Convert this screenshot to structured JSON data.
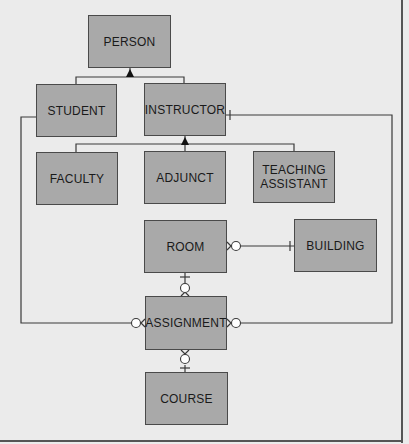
{
  "diagram": {
    "title": "",
    "colors": {
      "background": "#ebebeb",
      "entity_fill": "#a9a9a9",
      "entity_border": "#4a4a4a",
      "line": "#3a3a3a"
    },
    "entities": {
      "person": {
        "label": "PERSON"
      },
      "student": {
        "label": "STUDENT"
      },
      "instructor": {
        "label": "INSTRUCTOR"
      },
      "faculty": {
        "label": "FACULTY"
      },
      "adjunct": {
        "label": "ADJUNCT"
      },
      "teaching_assistant": {
        "label": "TEACHING\nASSISTANT"
      },
      "room": {
        "label": "ROOM"
      },
      "building": {
        "label": "BUILDING"
      },
      "assignment": {
        "label": "ASSIGNMENT"
      },
      "course": {
        "label": "COURSE"
      }
    },
    "relationships": [
      {
        "type": "generalization",
        "parent": "PERSON",
        "children": [
          "STUDENT",
          "INSTRUCTOR"
        ]
      },
      {
        "type": "generalization",
        "parent": "INSTRUCTOR",
        "children": [
          "FACULTY",
          "ADJUNCT",
          "TEACHING ASSISTANT"
        ]
      },
      {
        "from": "ROOM",
        "from_cardinality": "zero-or-many",
        "to": "BUILDING",
        "to_cardinality": "one"
      },
      {
        "from": "ROOM",
        "from_cardinality": "one",
        "to": "ASSIGNMENT",
        "to_cardinality": "zero-or-many"
      },
      {
        "from": "STUDENT",
        "from_cardinality": "none",
        "to": "ASSIGNMENT",
        "to_cardinality": "zero-or-many"
      },
      {
        "from": "INSTRUCTOR",
        "from_cardinality": "one",
        "to": "ASSIGNMENT",
        "to_cardinality": "zero-or-many"
      },
      {
        "from": "COURSE",
        "from_cardinality": "one",
        "to": "ASSIGNMENT",
        "to_cardinality": "zero-or-many"
      }
    ]
  }
}
